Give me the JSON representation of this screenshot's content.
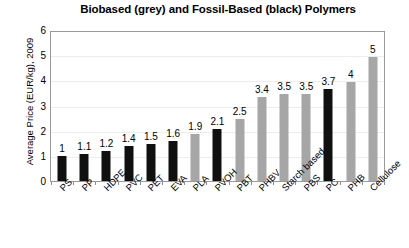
{
  "chart_data": {
    "type": "bar",
    "title": "Biobased (grey) and Fossil-Based (black) Polymers",
    "xlabel": "",
    "ylabel": "Average Price (EUR/kg), 2009",
    "ylim": [
      0,
      6
    ],
    "yticks": [
      "0",
      "1",
      "2",
      "3",
      "4",
      "5",
      "6"
    ],
    "grid": true,
    "legend_position": "none",
    "legend": [
      {
        "label": "Biobased",
        "color": "#a6a6a6"
      },
      {
        "label": "Fossil-Based",
        "color": "#101010"
      }
    ],
    "categories": [
      "PS",
      "PP",
      "HDPE",
      "PVC",
      "PET",
      "EVA",
      "PLA",
      "PVOH",
      "PBT",
      "PHBV",
      "Starch based",
      "PBS",
      "PC",
      "PHB",
      "Cellulose"
    ],
    "values": [
      1,
      1.1,
      1.2,
      1.4,
      1.5,
      1.6,
      1.9,
      2.1,
      2.5,
      3.4,
      3.5,
      3.5,
      3.7,
      4,
      5
    ],
    "value_labels": [
      "1",
      "1.1",
      "1.2",
      "1.4",
      "1.5",
      "1.6",
      "1.9",
      "2.1",
      "2.5",
      "3.4",
      "3.5",
      "3.5",
      "3.7",
      "4",
      "5"
    ],
    "bar_colors": [
      "black",
      "black",
      "black",
      "black",
      "black",
      "black",
      "grey",
      "black",
      "grey",
      "grey",
      "grey",
      "grey",
      "black",
      "grey",
      "grey"
    ],
    "colors": {
      "biobased": "#a6a6a6",
      "fossil": "#101010",
      "grid": "#ededed",
      "frame": "#9a9a9a"
    }
  }
}
